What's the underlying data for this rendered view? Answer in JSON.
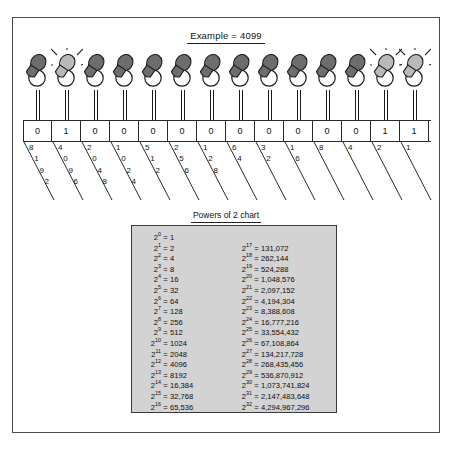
{
  "title": {
    "text": "Example = 4099"
  },
  "chart_caption": "Powers of 2 chart",
  "bulbs": {
    "count": 14,
    "states": [
      "off",
      "on",
      "off",
      "off",
      "off",
      "off",
      "off",
      "off",
      "off",
      "off",
      "off",
      "off",
      "on",
      "on"
    ],
    "colors": {
      "on": "#b9b9b9",
      "off": "#6d6d6d",
      "outline": "#1a1a1a",
      "ray": "#2a2a2a"
    }
  },
  "binary": {
    "digits": [
      "0",
      "1",
      "0",
      "0",
      "0",
      "0",
      "0",
      "0",
      "0",
      "0",
      "0",
      "0",
      "1",
      "1"
    ],
    "place_values": [
      "8192",
      "4096",
      "2048",
      "1024",
      "512",
      "256",
      "128",
      "64",
      "32",
      "16",
      "8",
      "4",
      "2",
      "1"
    ],
    "decimal_value": "4099"
  },
  "powers_chart": {
    "left": [
      {
        "exp": "0",
        "val": "1"
      },
      {
        "exp": "1",
        "val": "2"
      },
      {
        "exp": "2",
        "val": "4"
      },
      {
        "exp": "3",
        "val": "8"
      },
      {
        "exp": "4",
        "val": "16"
      },
      {
        "exp": "5",
        "val": "32"
      },
      {
        "exp": "6",
        "val": "64"
      },
      {
        "exp": "7",
        "val": "128"
      },
      {
        "exp": "8",
        "val": "256"
      },
      {
        "exp": "9",
        "val": "512"
      },
      {
        "exp": "10",
        "val": "1024"
      },
      {
        "exp": "11",
        "val": "2048"
      },
      {
        "exp": "12",
        "val": "4096"
      },
      {
        "exp": "13",
        "val": "8192"
      },
      {
        "exp": "14",
        "val": "16,384"
      },
      {
        "exp": "15",
        "val": "32,768"
      },
      {
        "exp": "16",
        "val": "65,536"
      }
    ],
    "right": [
      {
        "exp": "17",
        "val": "131,072"
      },
      {
        "exp": "18",
        "val": "262,144"
      },
      {
        "exp": "19",
        "val": "524,288"
      },
      {
        "exp": "20",
        "val": "1,048,576"
      },
      {
        "exp": "21",
        "val": "2,097,152"
      },
      {
        "exp": "22",
        "val": "4,194,304"
      },
      {
        "exp": "23",
        "val": "8,388,608"
      },
      {
        "exp": "24",
        "val": "16,777,216"
      },
      {
        "exp": "25",
        "val": "33,554,432"
      },
      {
        "exp": "26",
        "val": "67,108,864"
      },
      {
        "exp": "27",
        "val": "134,217,728"
      },
      {
        "exp": "28",
        "val": "268,435,456"
      },
      {
        "exp": "29",
        "val": "536,870,912"
      },
      {
        "exp": "30",
        "val": "1,073,741,824"
      },
      {
        "exp": "31",
        "val": "2,147,483,648"
      },
      {
        "exp": "32",
        "val": "4,294,967,296"
      }
    ],
    "base": "2",
    "equals": "="
  },
  "colors": {
    "border": "#4a4a4a",
    "chart_bg": "#d3d3d3",
    "chart_border": "#3a3a3a",
    "text": "#111111"
  }
}
